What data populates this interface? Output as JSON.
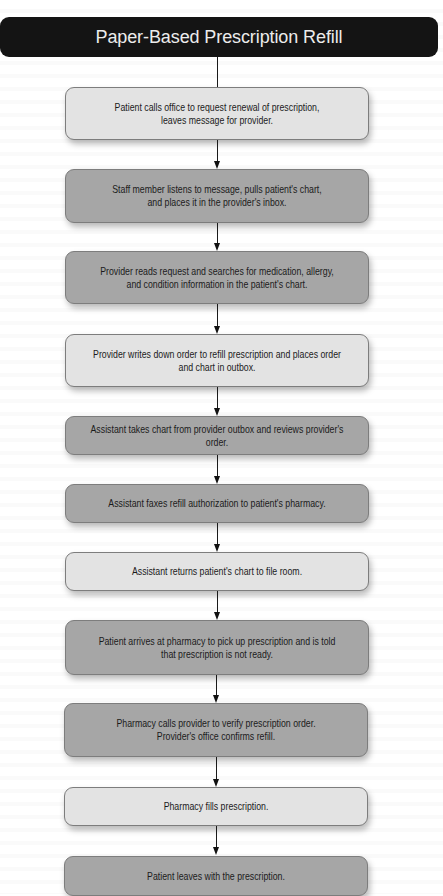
{
  "title": "Paper-Based Prescription Refill",
  "colors": {
    "title_bg": "#141414",
    "title_text": "#ececec",
    "step_light": "#e3e3e3",
    "step_dark": "#a6a6a6",
    "border": "#7d7d7d",
    "arrow": "#111111"
  },
  "steps": [
    {
      "text": "Patient calls office to request renewal of prescription,\nleaves message for provider.",
      "shade": "light"
    },
    {
      "text": "Staff member listens to message, pulls patient's chart,\nand places it in the provider's inbox.",
      "shade": "dark"
    },
    {
      "text": "Provider reads request and searches for medication, allergy,\nand condition information in the patient's chart.",
      "shade": "dark"
    },
    {
      "text": "Provider writes down order to refill prescription and places order\nand chart in outbox.",
      "shade": "light"
    },
    {
      "text": "Assistant takes chart from provider outbox and reviews provider's order.",
      "shade": "dark"
    },
    {
      "text": "Assistant faxes refill authorization to patient's pharmacy.",
      "shade": "dark"
    },
    {
      "text": "Assistant returns patient's chart to file room.",
      "shade": "light"
    },
    {
      "text": "Patient arrives at pharmacy to pick up prescription and is told\nthat prescription is not ready.",
      "shade": "dark"
    },
    {
      "text": "Pharmacy calls provider to verify prescription order.\nProvider's office confirms refill.",
      "shade": "dark"
    },
    {
      "text": "Pharmacy fills prescription.",
      "shade": "light"
    },
    {
      "text": "Patient leaves with the prescription.",
      "shade": "dark"
    }
  ]
}
